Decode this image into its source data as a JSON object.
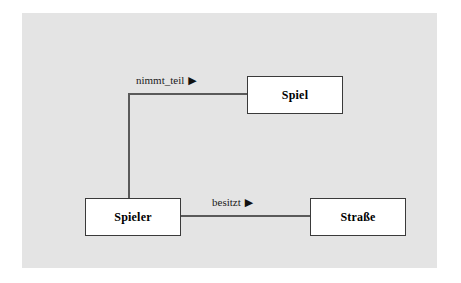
{
  "diagram": {
    "type": "entity-relationship-diagram",
    "background_color": "#e4e4e4",
    "page_background_color": "#ffffff",
    "box_fill_color": "#ffffff",
    "box_border_color": "#3a3a3a",
    "connector_color": "#5a5a5a",
    "text_color": "#000000",
    "entities": [
      {
        "id": "spiel",
        "label": "Spiel"
      },
      {
        "id": "spieler",
        "label": "Spieler"
      },
      {
        "id": "strasse",
        "label": "Straße"
      }
    ],
    "relationships": [
      {
        "id": "nimmt-teil",
        "label": "nimmt_teil",
        "arrow": "▶",
        "from": "Spieler",
        "to": "Spiel"
      },
      {
        "id": "besitzt",
        "label": "besitzt",
        "arrow": "▶",
        "from": "Spieler",
        "to": "Straße"
      }
    ]
  }
}
